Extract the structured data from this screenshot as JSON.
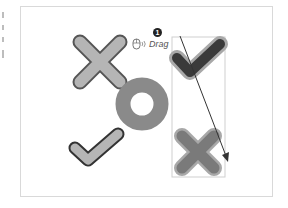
{
  "annotation": {
    "step_number": "1",
    "action_label": "Drag",
    "icons": [
      "mouse-icon"
    ]
  },
  "shapes": [
    {
      "type": "cross",
      "style": "light",
      "position": "top-left"
    },
    {
      "type": "ring",
      "style": "medium",
      "position": "center"
    },
    {
      "type": "check",
      "style": "light",
      "position": "bottom-left"
    },
    {
      "type": "check",
      "style": "dark-selected",
      "position": "top-right"
    },
    {
      "type": "cross",
      "style": "medium-selected",
      "position": "bottom-right"
    }
  ],
  "colors": {
    "light_fill": "#b5b5b5",
    "dark_outline": "#555555",
    "ring_fill": "#8a8a8a",
    "selected_fill": "#3a3a3a",
    "selected_halo": "#a8a8a8",
    "frame_border": "#d9d9d9"
  }
}
